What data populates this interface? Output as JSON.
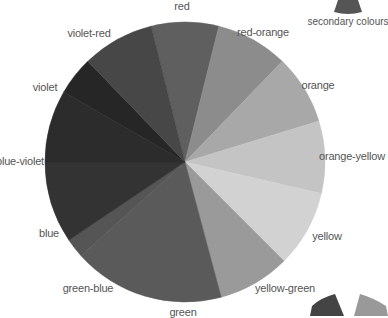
{
  "diagram": {
    "type": "colour-wheel",
    "center": [
      185,
      162
    ],
    "radius": 140,
    "segments": [
      {
        "name": "red",
        "start": -14,
        "end": 14,
        "fill": "#5f5f5f",
        "label_pos": [
          182,
          6
        ]
      },
      {
        "name": "red-orange",
        "start": 14,
        "end": 44,
        "fill": "#8c8c8c",
        "label_pos": [
          263,
          32
        ]
      },
      {
        "name": "orange",
        "start": 44,
        "end": 73,
        "fill": "#a8a8a8",
        "label_pos": [
          318,
          85
        ]
      },
      {
        "name": "orange-yellow",
        "start": 73,
        "end": 103,
        "fill": "#c4c4c4",
        "label_pos": [
          352,
          156
        ]
      },
      {
        "name": "yellow",
        "start": 103,
        "end": 135,
        "fill": "#d2d2d2",
        "label_pos": [
          327,
          236
        ]
      },
      {
        "name": "yellow-green",
        "start": 135,
        "end": 165,
        "fill": "#9a9a9a",
        "label_pos": [
          285,
          288
        ]
      },
      {
        "name": "green",
        "start": 165,
        "end": 228,
        "fill": "#5a5a5a",
        "label_pos": [
          183,
          312
        ]
      },
      {
        "name": "green-blue",
        "start": 228,
        "end": 236,
        "fill": "#555555",
        "label_pos": [
          88,
          288
        ]
      },
      {
        "name": "blue",
        "start": 236,
        "end": 270,
        "fill": "#333333",
        "label_pos": [
          49,
          233
        ]
      },
      {
        "name": "blue-violet",
        "start": 270,
        "end": 300,
        "fill": "#2c2c2c",
        "label_pos": [
          20,
          161
        ]
      },
      {
        "name": "violet",
        "start": 300,
        "end": 316,
        "fill": "#262626",
        "label_pos": [
          45,
          87
        ]
      },
      {
        "name": "violet-red",
        "start": 316,
        "end": 346,
        "fill": "#474747",
        "label_pos": [
          89,
          33
        ]
      }
    ]
  },
  "legends": {
    "secondary": {
      "label": "secondary colours",
      "swatch_fill": "#555555"
    },
    "bottom_swatches": [
      {
        "fill": "#444444"
      },
      {
        "fill": "#999999"
      }
    ]
  }
}
